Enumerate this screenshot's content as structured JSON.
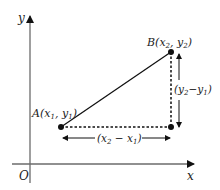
{
  "diagram": {
    "axes": {
      "x_label": "x",
      "y_label": "y",
      "origin_label": "O"
    },
    "points": {
      "A": {
        "name": "A",
        "x_sym": "x",
        "x_sub": "1",
        "y_sym": "y",
        "y_sub": "1"
      },
      "B": {
        "name": "B",
        "x_sym": "x",
        "x_sub": "2",
        "y_sym": "y",
        "y_sub": "2"
      }
    },
    "dimensions": {
      "horizontal": {
        "a": "x",
        "a_sub": "2",
        "op": " − ",
        "b": "x",
        "b_sub": "1"
      },
      "vertical": {
        "a": "y",
        "a_sub": "2",
        "op": "−",
        "b": "y",
        "b_sub": "1"
      }
    },
    "colors": {
      "axis": "#6b6b6b",
      "line": "#111111",
      "text": "#222222"
    }
  }
}
